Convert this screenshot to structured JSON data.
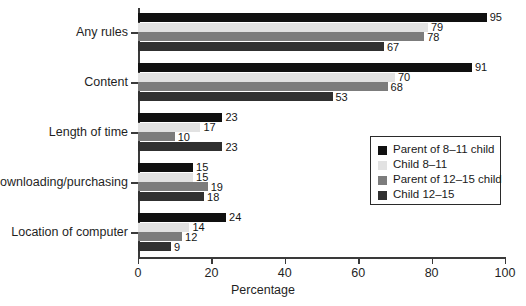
{
  "chart_data": {
    "type": "bar",
    "orientation": "horizontal",
    "grouped": true,
    "title": "",
    "subtitle": "",
    "xlabel": "Percentage",
    "ylabel": "",
    "xlim": [
      0,
      100
    ],
    "xticks": [
      0,
      20,
      40,
      60,
      80,
      100
    ],
    "xticklabels": [
      "0",
      "20",
      "40",
      "60",
      "80",
      "100"
    ],
    "grid": false,
    "legend_position": "center-right inside plot",
    "categories": [
      "Any rules",
      "Content",
      "Length of time",
      "Downloading/purchasing",
      "Location of computer"
    ],
    "series": [
      {
        "name": "Parent of 8–11 child",
        "color": "#101010",
        "values": [
          95,
          91,
          23,
          15,
          24
        ]
      },
      {
        "name": "Child 8–11",
        "color": "#e2e2e2",
        "values": [
          79,
          70,
          17,
          15,
          14
        ]
      },
      {
        "name": "Parent of 12–15 child",
        "color": "#7c7c7c",
        "values": [
          78,
          68,
          10,
          19,
          12
        ]
      },
      {
        "name": "Child 12–15",
        "color": "#303030",
        "values": [
          67,
          53,
          23,
          18,
          9
        ]
      }
    ],
    "data_labels": [
      [
        "95",
        "79",
        "78",
        "67"
      ],
      [
        "91",
        "70",
        "68",
        "53"
      ],
      [
        "23",
        "17",
        "10",
        "23"
      ],
      [
        "15",
        "15",
        "19",
        "18"
      ],
      [
        "24",
        "14",
        "12",
        "9"
      ]
    ],
    "annotations": []
  },
  "legend": {
    "entries": [
      {
        "label": "Parent of 8–11 child",
        "color": "#101010"
      },
      {
        "label": "Child 8–11",
        "color": "#e2e2e2"
      },
      {
        "label": "Parent of 12–15 child",
        "color": "#7c7c7c"
      },
      {
        "label": "Child 12–15",
        "color": "#303030"
      }
    ]
  },
  "axis": {
    "x_label": "Percentage",
    "x_tick_labels": [
      "0",
      "20",
      "40",
      "60",
      "80",
      "100"
    ],
    "y_tick_labels": [
      "Any rules",
      "Content",
      "Length of time",
      "Downloading/purchasing",
      "Location of computer"
    ]
  },
  "colors": {
    "axis": "#3a3a3a",
    "text": "#1a1a1a",
    "background": "#ffffff",
    "legend_border": "#2a2a2a"
  }
}
